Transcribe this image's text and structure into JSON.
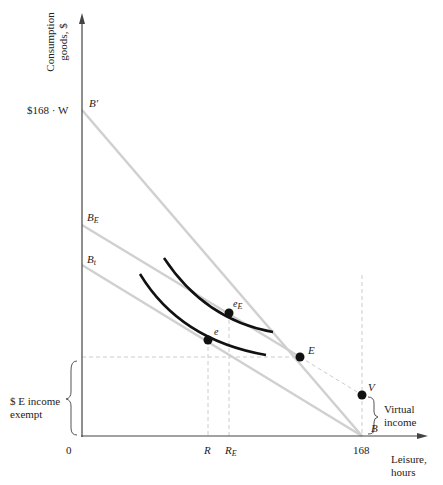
{
  "axes": {
    "y_label_line1": "Consumption",
    "y_label_line2": "goods, $",
    "x_label_line1": "Leisure,",
    "x_label_line2": "hours",
    "origin": "0",
    "x_tick_168": "168",
    "y_tick_max": "$168 · W",
    "x_tick_R": "R",
    "x_tick_RE_base": "R",
    "x_tick_RE_sub": "E"
  },
  "lines": {
    "B_prime": "B′",
    "B_E_base": "B",
    "B_E_sub": "E",
    "B_t_base": "B",
    "B_t_sub": "t",
    "B": "B"
  },
  "points": {
    "E": "E",
    "V": "V",
    "e": "e",
    "eE_base": "e",
    "eE_sub": "E"
  },
  "annotations": {
    "exempt_line1": "$ E income",
    "exempt_line2": "exempt",
    "virtual_line1": "Virtual",
    "virtual_line2": "income"
  },
  "colors": {
    "budget_lines": "#d0d0d0",
    "indifference_curves": "#111111",
    "axes": "#444444",
    "guides": "#cccccc"
  }
}
